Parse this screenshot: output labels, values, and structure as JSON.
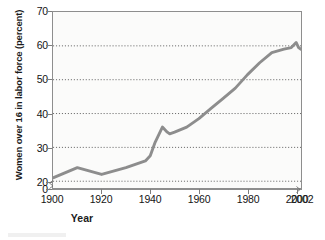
{
  "chart_data": {
    "type": "line",
    "title": "",
    "xlabel": "Year",
    "ylabel": "Women over 16 in labor force (percent)",
    "xlim": [
      1900,
      2002
    ],
    "ylim": [
      18,
      70
    ],
    "grid": true,
    "grid_axis": "y",
    "legend": "none",
    "axis_break": {
      "x": true,
      "y": true
    },
    "xticks": [
      "1900",
      "1920",
      "1940",
      "1960",
      "1980",
      "2000",
      "2002"
    ],
    "xtick_values": [
      1900,
      1920,
      1940,
      1960,
      1980,
      2000,
      2002
    ],
    "yticks": [
      "0",
      "20",
      "30",
      "40",
      "50",
      "60",
      "70"
    ],
    "ytick_values": [
      18,
      20,
      30,
      40,
      50,
      60,
      70
    ],
    "gridline_values": [
      20,
      30,
      40,
      50,
      60
    ],
    "series": [
      {
        "name": "Women over 16 in labor force",
        "color": "#8d8d8d",
        "x": [
          1900,
          1910,
          1920,
          1930,
          1938,
          1940,
          1942,
          1945,
          1947,
          1948,
          1950,
          1955,
          1960,
          1965,
          1970,
          1975,
          1980,
          1985,
          1990,
          1995,
          1998,
          2000,
          2001,
          2002
        ],
        "values": [
          21.0,
          24.0,
          22.0,
          24.0,
          26.0,
          27.5,
          31.5,
          36.0,
          34.5,
          34.0,
          34.5,
          36.0,
          38.5,
          41.5,
          44.5,
          47.5,
          51.5,
          55.0,
          58.0,
          59.0,
          59.5,
          61.0,
          59.5,
          59.0
        ]
      }
    ]
  },
  "axis": {
    "ylabel_text": "Women over 16 in labor force (percent)",
    "xlabel_text": "Year"
  }
}
